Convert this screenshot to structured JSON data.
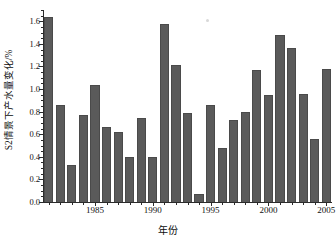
{
  "chart_data": {
    "type": "bar",
    "title": "",
    "xlabel": "年份",
    "ylabel": "S2情景下产水量变化/%",
    "categories": [
      "1981",
      "1982",
      "1983",
      "1984",
      "1985",
      "1986",
      "1987",
      "1988",
      "1989",
      "1990",
      "1991",
      "1992",
      "1993",
      "1994",
      "1995",
      "1996",
      "1997",
      "1998",
      "1999",
      "2000",
      "2001",
      "2002",
      "2003",
      "2004",
      "2005"
    ],
    "values": [
      1.64,
      0.86,
      0.33,
      0.77,
      1.04,
      0.66,
      0.62,
      0.4,
      0.74,
      0.4,
      1.58,
      1.21,
      0.79,
      0.07,
      0.86,
      0.48,
      0.73,
      0.8,
      1.17,
      0.95,
      1.48,
      1.36,
      0.96,
      0.56,
      1.18
    ],
    "ylim": [
      0.0,
      1.7
    ],
    "xlim": [
      1980.5,
      2005.5
    ],
    "ytick_labels": [
      "0.0",
      "0.2",
      "0.4",
      "0.6",
      "0.8",
      "1.0",
      "1.2",
      "1.4",
      "1.6"
    ],
    "ytick_values": [
      0.0,
      0.2,
      0.4,
      0.6,
      0.8,
      1.0,
      1.2,
      1.4,
      1.6
    ],
    "yminor_step": 0.05,
    "xtick_labels": [
      "1985",
      "1990",
      "1995",
      "2000",
      "2005"
    ],
    "xtick_values": [
      1985,
      1990,
      1995,
      2000,
      2005
    ],
    "grid": false,
    "legend": null,
    "bar_color": "#5a5a5a",
    "axis_color": "#2b2b2b",
    "background": "#ffffff"
  }
}
